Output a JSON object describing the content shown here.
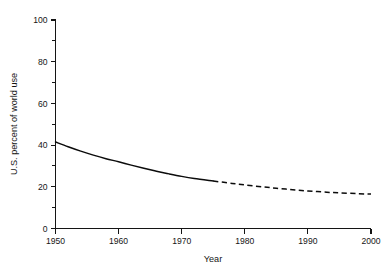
{
  "chart_data": {
    "type": "line",
    "title": "",
    "xlabel": "Year",
    "ylabel": "U.S. percent of world use",
    "xlim": [
      1950,
      2000
    ],
    "ylim": [
      0,
      100
    ],
    "grid": false,
    "legend": null,
    "x_ticks": [
      1950,
      1960,
      1970,
      1980,
      1990,
      2000
    ],
    "x_tick_labels": [
      "1950",
      "1960",
      "1970",
      "1980",
      "1990",
      "2000"
    ],
    "x_minor_ticks": [
      1955,
      1965,
      1975,
      1985,
      1995
    ],
    "y_ticks": [
      0,
      20,
      40,
      60,
      80,
      100
    ],
    "y_tick_labels": [
      "0",
      "20",
      "40",
      "60",
      "80",
      "100"
    ],
    "y_minor_ticks": [
      10,
      30,
      50,
      70,
      90
    ],
    "series": [
      {
        "name": "U.S. percent of world use",
        "style": "solid",
        "note": "historical",
        "x": [
          1950,
          1952,
          1954,
          1956,
          1958,
          1960,
          1962,
          1964,
          1966,
          1968,
          1970,
          1972,
          1975
        ],
        "values": [
          41.5,
          39.2,
          37.1,
          35.2,
          33.5,
          32.0,
          30.4,
          28.9,
          27.5,
          26.2,
          25.0,
          24.0,
          22.8
        ]
      },
      {
        "name": "U.S. percent of world use (projected)",
        "style": "dashed",
        "note": "projected",
        "x": [
          1975,
          1978,
          1980,
          1983,
          1985,
          1988,
          1990,
          1993,
          1995,
          1998,
          2000
        ],
        "values": [
          22.8,
          21.6,
          20.9,
          19.9,
          19.3,
          18.5,
          18.0,
          17.4,
          17.1,
          16.7,
          16.5
        ]
      }
    ]
  },
  "axis_labels": {
    "x_title": "Year",
    "y_title": "U.S. percent of world use"
  },
  "colors": {
    "line": "#0b0b0b",
    "axis": "#141414",
    "background": "#ffffff",
    "text": "#151515"
  }
}
